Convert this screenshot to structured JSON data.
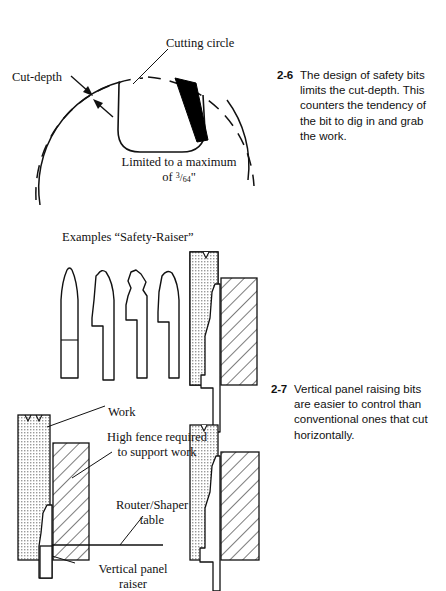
{
  "page": {
    "width": 446,
    "height": 591,
    "background": "#ffffff",
    "ink": "#111111"
  },
  "figures": [
    {
      "id": "fig-2-6",
      "number": "2-6",
      "caption": "The design of safety bits limits the cut-depth. This counters the tendency of the bit to dig in and grab the work.",
      "labels": {
        "cutting_circle": "Cutting circle",
        "cut_depth": "Cut-depth",
        "limited_line1": "Limited to a maximum",
        "limited_line2_prefix": "of ",
        "limited_numerator": "3",
        "limited_denominator": "64",
        "limited_unit": "\""
      }
    },
    {
      "id": "fig-2-7",
      "number": "2-7",
      "caption": "Vertical panel raising bits are easier to control than conventional ones that cut horizontally.",
      "labels": {
        "examples": "Examples “Safety-Raiser”",
        "work": "Work",
        "high_fence_line1": "High fence required",
        "high_fence_line2": "to support work",
        "router_line1": "Router/Shaper",
        "router_line2": "table",
        "vertical_line1": "Vertical panel",
        "vertical_line2": "raiser"
      }
    }
  ],
  "colors": {
    "ink": "#111111",
    "stipple": "#d4d4d4",
    "cutter_fill": "#000000",
    "paper": "#ffffff"
  }
}
